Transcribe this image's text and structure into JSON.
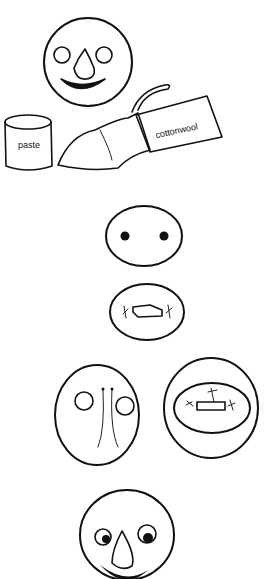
{
  "illustration": {
    "description": "Step-by-step drawings for making a face mask with paste and cottonwool",
    "steps": [
      {
        "id": "materials",
        "items": [
          "finished face",
          "paste",
          "cottonwool"
        ]
      },
      {
        "id": "step-eyes-and-mouth-holes"
      },
      {
        "id": "step-nose-strings-and-mouth-frame"
      },
      {
        "id": "finished-face"
      }
    ],
    "labels": {
      "paste": "paste",
      "cottonwool": "cottonwool"
    },
    "colors": {
      "ink": "#111111",
      "paper": "#ffffff"
    }
  }
}
